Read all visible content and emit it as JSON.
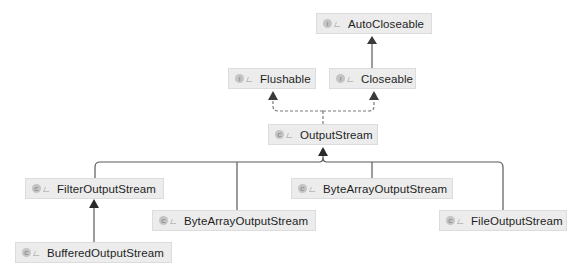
{
  "diagram": {
    "type": "class-hierarchy",
    "colors": {
      "node_bg": "#ececec",
      "node_border": "#dcdcdc",
      "edge": "#5a5a5a",
      "text": "#1e1e1e"
    },
    "nodes": [
      {
        "id": "autocloseable",
        "label": "AutoCloseable",
        "kind": "interface",
        "kind_glyph": "I",
        "x": 316,
        "y": 13,
        "w": 116
      },
      {
        "id": "flushable",
        "label": "Flushable",
        "kind": "interface",
        "kind_glyph": "I",
        "x": 228,
        "y": 68,
        "w": 88
      },
      {
        "id": "closeable",
        "label": "Closeable",
        "kind": "interface",
        "kind_glyph": "I",
        "x": 329,
        "y": 68,
        "w": 87
      },
      {
        "id": "outputstream",
        "label": "OutputStream",
        "kind": "abstract-class",
        "kind_glyph": "C",
        "x": 268,
        "y": 124,
        "w": 110
      },
      {
        "id": "filteroutputstream",
        "label": "FilterOutputStream",
        "kind": "class",
        "kind_glyph": "C",
        "x": 25,
        "y": 178,
        "w": 139
      },
      {
        "id": "bytearrayoutputstream-1",
        "label": "ByteArrayOutputStream",
        "kind": "class",
        "kind_glyph": "C",
        "x": 291,
        "y": 178,
        "w": 162
      },
      {
        "id": "bytearrayoutputstream-2",
        "label": "ByteArrayOutputStream",
        "kind": "class",
        "kind_glyph": "C",
        "x": 152,
        "y": 210,
        "w": 164
      },
      {
        "id": "fileoutputstream",
        "label": "FileOutputStream",
        "kind": "class",
        "kind_glyph": "C",
        "x": 439,
        "y": 210,
        "w": 128
      },
      {
        "id": "bufferedoutputstream",
        "label": "BufferedOutputStream",
        "kind": "class",
        "kind_glyph": "C",
        "x": 15,
        "y": 242,
        "w": 157
      }
    ],
    "edges": [
      {
        "from": "closeable",
        "to": "autocloseable",
        "style": "solid",
        "relation": "extends"
      },
      {
        "from": "outputstream",
        "to": "flushable",
        "style": "dashed",
        "relation": "implements"
      },
      {
        "from": "outputstream",
        "to": "closeable",
        "style": "dashed",
        "relation": "implements"
      },
      {
        "from": "filteroutputstream",
        "to": "outputstream",
        "style": "solid",
        "relation": "extends"
      },
      {
        "from": "bytearrayoutputstream-2",
        "to": "outputstream",
        "style": "solid",
        "relation": "extends"
      },
      {
        "from": "bytearrayoutputstream-1",
        "to": "outputstream",
        "style": "solid",
        "relation": "extends"
      },
      {
        "from": "fileoutputstream",
        "to": "outputstream",
        "style": "solid",
        "relation": "extends"
      },
      {
        "from": "bufferedoutputstream",
        "to": "filteroutputstream",
        "style": "solid",
        "relation": "extends"
      }
    ]
  }
}
